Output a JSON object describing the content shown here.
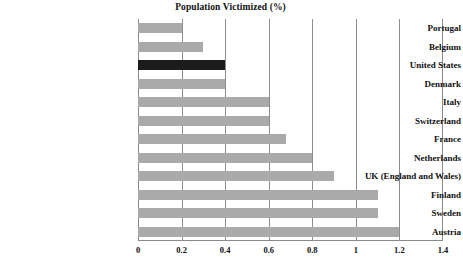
{
  "chart_data": {
    "type": "bar",
    "orientation": "horizontal",
    "title": "Population Victimized (%)",
    "xlabel": "",
    "ylabel": "",
    "xlim": [
      0,
      1.4
    ],
    "xticks": [
      "0",
      "0.2",
      "0.4",
      "0.6",
      "0.8",
      "1",
      "1.2",
      "1.4"
    ],
    "xtick_values": [
      0,
      0.2,
      0.4,
      0.6,
      0.8,
      1.0,
      1.2,
      1.4
    ],
    "grid": "vertical",
    "legend": "none",
    "categories": [
      "Portugal",
      "Belgium",
      "United States",
      "Denmark",
      "Italy",
      "Switzerland",
      "France",
      "Netherlands",
      "UK (England and Wales)",
      "Finland",
      "Sweden",
      "Austria"
    ],
    "values": [
      0.2,
      0.3,
      0.4,
      0.4,
      0.6,
      0.6,
      0.68,
      0.8,
      0.9,
      1.1,
      1.1,
      1.2
    ],
    "highlight_category": "United States",
    "colors": {
      "bar": "#aaaaaa",
      "highlight_bar": "#1c1c1c",
      "axis": "#8a8a8a",
      "grid": "#8e8e8e",
      "text": "#111111",
      "background": "#ffffff"
    }
  }
}
